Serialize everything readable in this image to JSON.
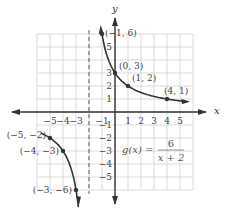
{
  "chart_data": {
    "type": "line",
    "title": "",
    "function_label": "g(x) = 6 / (x + 2)",
    "equation": {
      "lhs": "g(x) =",
      "numerator": "6",
      "denominator": "x + 2"
    },
    "xlabel": "x",
    "ylabel": "y",
    "xlim": [
      -6,
      6
    ],
    "ylim": [
      -6,
      6
    ],
    "grid": true,
    "x_ticks": [
      "−5",
      "−4",
      "−3",
      "−1",
      "1",
      "2",
      "3",
      "4",
      "5"
    ],
    "y_ticks": [
      "5",
      "3",
      "2",
      "1",
      "−1",
      "−2",
      "−3",
      "−4",
      "−5"
    ],
    "vertical_asymptote": {
      "x": -2,
      "style": "dashed"
    },
    "points": [
      {
        "x": -1,
        "y": 6,
        "label": "(−1, 6)"
      },
      {
        "x": 0,
        "y": 3,
        "label": "(0, 3)"
      },
      {
        "x": 1,
        "y": 2,
        "label": "(1, 2)"
      },
      {
        "x": 4,
        "y": 1,
        "label": "(4, 1)"
      },
      {
        "x": -5,
        "y": -2,
        "label": "(−5, −2)"
      },
      {
        "x": -4,
        "y": -3,
        "label": "(−4, −3)"
      },
      {
        "x": -3,
        "y": -6,
        "label": "(−3, −6)"
      }
    ],
    "series": [
      {
        "name": "right branch",
        "domain": [
          -1.05,
          5.5
        ]
      },
      {
        "name": "left branch",
        "domain": [
          -5.6,
          -2.95
        ]
      }
    ],
    "colors": {
      "curve": "#333333",
      "grid": "#cccccc",
      "axis": "#333333",
      "asymptote": "#555555"
    }
  }
}
